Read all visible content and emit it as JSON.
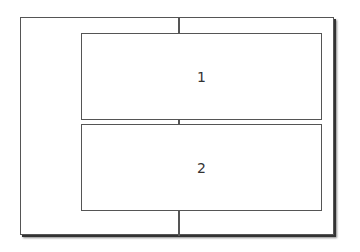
{
  "diagram": {
    "boxes": [
      {
        "label": "1"
      },
      {
        "label": "2"
      }
    ],
    "colors": {
      "line": "#555555",
      "background": "#ffffff",
      "text": "#333333"
    }
  }
}
